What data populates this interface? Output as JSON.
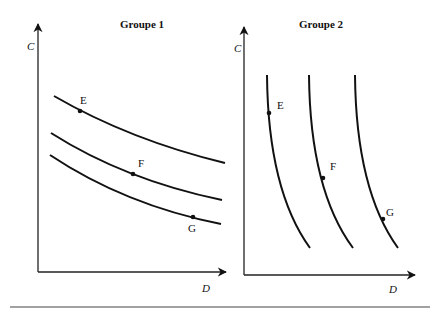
{
  "panels": [
    {
      "title": "Groupe 1",
      "y_axis_label": "C",
      "x_axis_label": "D",
      "curve_shape": "gentle-downward-slope",
      "curves": [
        {
          "point_label": "E"
        },
        {
          "point_label": "F"
        },
        {
          "point_label": "G"
        }
      ]
    },
    {
      "title": "Groupe 2",
      "y_axis_label": "C",
      "x_axis_label": "D",
      "curve_shape": "steep-downward-slope",
      "curves": [
        {
          "point_label": "E"
        },
        {
          "point_label": "F"
        },
        {
          "point_label": "G"
        }
      ]
    }
  ]
}
